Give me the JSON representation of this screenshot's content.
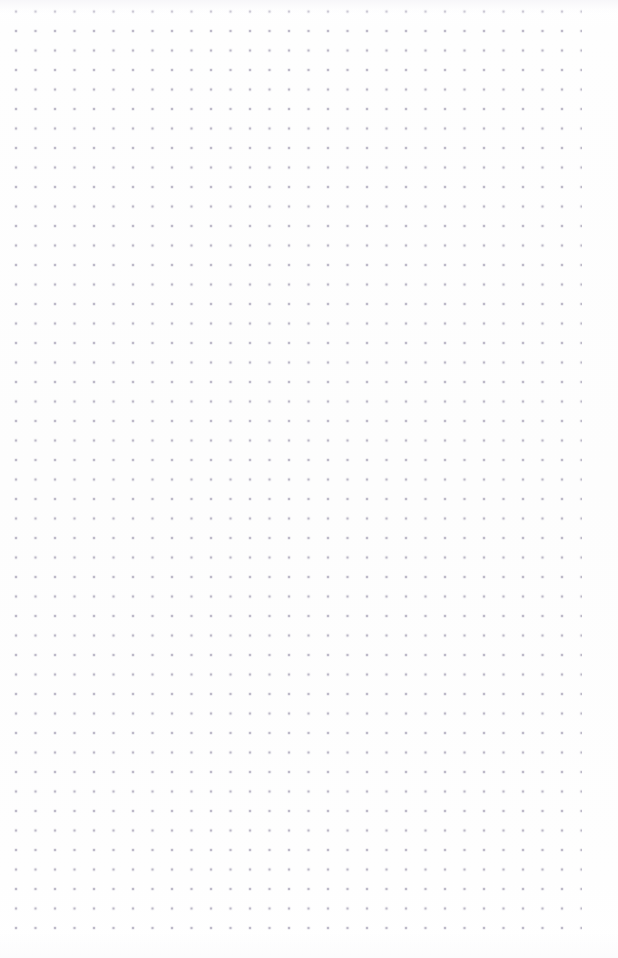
{
  "page": {
    "kind": "dot-grid-notebook-page",
    "width": 618,
    "height": 958,
    "background_color": "#fefefe",
    "paper_tint_color": "#fdfdfd",
    "written_content": "",
    "content_note": "Page is blank — no handwriting, text, or marks present"
  },
  "grid": {
    "dot_color": "#b8b4c4",
    "dot_edge_color": "#9692a3",
    "dot_diameter_px": 1.3,
    "pitch_x_px": 19.5,
    "pitch_y_px": 19.5,
    "first_dot_x_px": 16,
    "first_dot_y_px": 31,
    "last_dot_x_px": 572,
    "last_dot_y_px": 921,
    "columns": 29,
    "rows": 46,
    "margin_top_px": 31,
    "margin_bottom_px": 37,
    "margin_left_px": 16,
    "margin_right_px": 46,
    "left_edge_clipped_column": true
  }
}
